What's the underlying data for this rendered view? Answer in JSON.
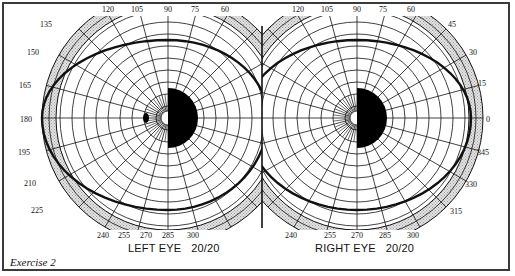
{
  "figure": {
    "caption": "Exercise 2",
    "eyes": [
      {
        "id": "left",
        "label": "LEFT EYE   20/20",
        "center": [
          168,
          118
        ],
        "degree_labels": [
          "135",
          "150",
          "165",
          "180",
          "195",
          "210",
          "225",
          "240",
          "255",
          "270",
          "285",
          "300",
          "120",
          "105",
          "90",
          "75",
          "60"
        ],
        "blind_spot_side": "right",
        "extra_scotoma": true
      },
      {
        "id": "right",
        "label": "RIGHT EYE   20/20",
        "center": [
          357,
          118
        ],
        "degree_labels": [
          "120",
          "105",
          "90",
          "75",
          "60",
          "45",
          "30",
          "15",
          "0",
          "345",
          "330",
          "315",
          "240",
          "255",
          "270",
          "285",
          "300"
        ],
        "blind_spot_side": "right",
        "extra_scotoma": false
      }
    ],
    "colors": {
      "line": "#111111",
      "shade": "#c8c8c8",
      "fill": "#000000",
      "background": "#ffffff"
    }
  }
}
